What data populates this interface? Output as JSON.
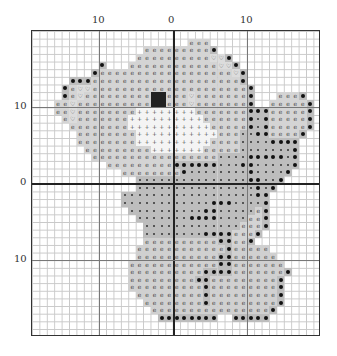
{
  "chart": {
    "columns": 39,
    "rows": 40,
    "center_col": 19,
    "center_row": 20,
    "top_labels": [
      {
        "text": "10",
        "col": 9
      },
      {
        "text": "0",
        "col": 19
      },
      {
        "text": "10",
        "col": 29
      }
    ],
    "left_labels": [
      {
        "text": "10",
        "row": 10
      },
      {
        "text": "0",
        "row": 20
      },
      {
        "text": "10",
        "row": 30
      }
    ],
    "legend_symbols": {
      "e": "light grey fill with 'e' circle symbol (head/fur)",
      "h": "light grey with heart outline symbol",
      "d": "medium grey with small dot (body)",
      "b": "medium grey with black heart/large dot (shading)",
      "p": "white with plus symbol (muzzle)",
      "k": "black (eyes/nose)"
    },
    "grid": [
      ".......................................",
      ".....................eee...............",
      "...............eeeeeeeeeb..............",
      "..............eeeeeeeeeehhb............",
      ".........b...eeeeeeeeeeeehhb...........",
      "........beeeeeeeeeeeeeeeeeehb..........",
      ".....bbbeeeeeeeeeeeeeeeeeeeeb..........",
      "....behheeeeeeeeeeeeeeeeeeeeeb.........",
      "....beheeeeeeeeekkeeeheeeeeeeb...eeeb..",
      "...eeheeeeeeeeeekkeeeheeeeeeeb..eeeeeb.",
      "...eeheeeeeeeeppppppppeeeeeeebbbeeeeeb.",
      "....eheeeeeeeppppppppppeeeeeebdbeeeeeb.",
      ".....eeeeeeeepppppppppppeeeeebdbeeeeeb.",
      "......eeeeeeeepppppppppppeeeddbbeeeeb..",
      "......eeeeeeeeppppppppppeeeeddddbbbb...",
      ".......eeeeeeeeepppppppeeeeedddddddb...",
      "........eeeeeeeeeeeeeeeeeddddbbbbbdb...",
      "..........eeeeeeeeebbbbbbdddbbdddddb...",
      "............eeeeeeeebddddddddbddddb....",
      "..............dddddddddddddddbbddb.....",
      "..............ddddddddddddddddbdb......",
      "............ddddddddddddddddddbb.......",
      "............ddddddddddddbbbddddb.......",
      ".............ddddddddddbbdddddeb.......",
      "..............dddddddbbbbddddeeb.......",
      "...............dddddddddddddeeeb.......",
      "...............ddddddddbbbbeeeb........",
      "...............ffffffffffbbeeb.........",
      "..............ffffffffffffbfffff.......",
      "..............fffffffffffbbffffff......",
      ".............ffffffffffffbbfffffff.....",
      ".............ffffffffffbbbbfffffffb....",
      ".............fffffffffbbfffffffffb.....",
      ".............ffffffffffbfffffffffb.....",
      "..............fffffffffbfffffffffb.....",
      "...............ffffffffbfffffffffb.....",
      "................ffffffffffffffffb......",
      ".................bbbbbbbb..bbbbb.......",
      ".......................................",
      "......................................."
    ]
  }
}
